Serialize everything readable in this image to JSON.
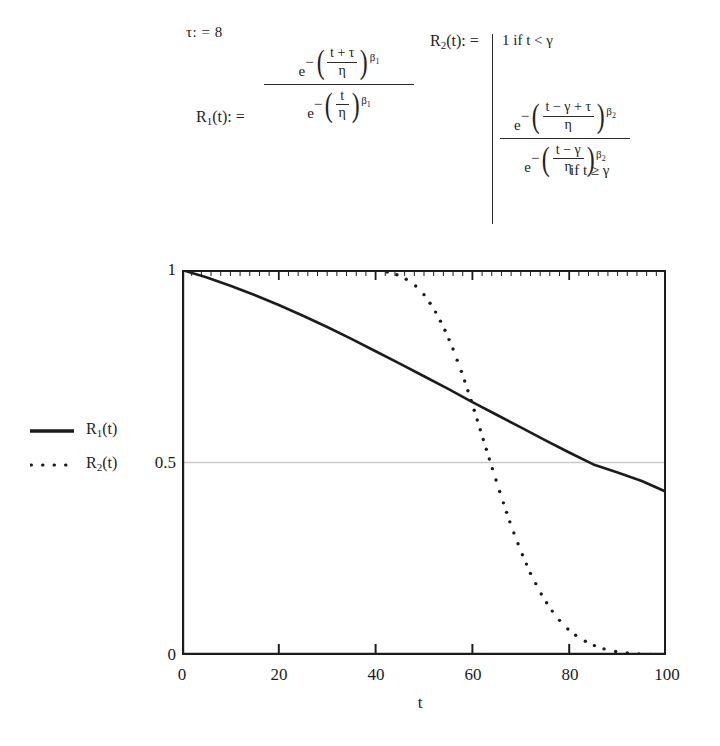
{
  "formulas": {
    "tau_assignment": "τ: = 8",
    "r1_label": "R",
    "r1_sub": "1",
    "r1_assign": "(t): =",
    "r1_numerator": {
      "e": "e",
      "minus": "−",
      "num": "t + τ",
      "den": "η",
      "exponent_base": "β",
      "exponent_sub": "1"
    },
    "r1_denominator": {
      "e": "e",
      "minus": "−",
      "num": "t",
      "den": "η",
      "exponent_base": "β",
      "exponent_sub": "1"
    },
    "r2_label": "R",
    "r2_sub": "2",
    "r2_assign": "(t): =",
    "r2_case1": "1 if t < γ",
    "r2_case2_condition": "if t ≥ γ",
    "r2_numerator": {
      "e": "e",
      "minus": "−",
      "num": "t − γ + τ",
      "den": "η",
      "exponent_base": "β",
      "exponent_sub": "2"
    },
    "r2_denominator": {
      "e": "e",
      "minus": "−",
      "num": "t − γ",
      "den": "η",
      "exponent_base": "β",
      "exponent_sub": "2"
    }
  },
  "legend": {
    "items": [
      {
        "label_base": "R",
        "label_sub": "1",
        "label_tail": "(t)",
        "style": "solid",
        "color": "#1c1c1c"
      },
      {
        "label_base": "R",
        "label_sub": "2",
        "label_tail": "(t)",
        "style": "dotted",
        "color": "#1c1c1c"
      }
    ]
  },
  "chart_data": {
    "type": "line",
    "title": "",
    "xlabel": "t",
    "ylabel": "",
    "xlim": [
      0,
      100
    ],
    "ylim": [
      0,
      1
    ],
    "xticks": [
      0,
      20,
      40,
      60,
      80,
      100
    ],
    "xtick_labels": [
      "0",
      "20",
      "40",
      "60",
      "80",
      "100"
    ],
    "yticks": [
      0,
      0.5,
      1
    ],
    "ytick_labels": [
      "0",
      "0.5",
      "1"
    ],
    "grid": true,
    "gridlines_y": [
      0.5
    ],
    "legend_position": "left-outside",
    "series": [
      {
        "name": "R_1(t)",
        "style": "solid",
        "color": "#1c1c1c",
        "x": [
          0,
          5,
          10,
          15,
          20,
          25,
          30,
          35,
          40,
          45,
          50,
          55,
          60,
          65,
          70,
          75,
          80,
          85,
          90,
          95,
          100
        ],
        "y": [
          1.0,
          0.981,
          0.959,
          0.935,
          0.909,
          0.881,
          0.852,
          0.821,
          0.789,
          0.757,
          0.724,
          0.691,
          0.657,
          0.624,
          0.591,
          0.558,
          0.526,
          0.495,
          0.474,
          0.452,
          0.424
        ]
      },
      {
        "name": "R_2(t)",
        "style": "dotted",
        "color": "#1c1c1c",
        "x": [
          0,
          5,
          10,
          15,
          20,
          25,
          30,
          35,
          40,
          42,
          44,
          46,
          48,
          50,
          52,
          54,
          56,
          58,
          60,
          62,
          64,
          66,
          68,
          70,
          72,
          74,
          76,
          78,
          80,
          82,
          84,
          86,
          88,
          90,
          92,
          94,
          96,
          98,
          100
        ],
        "y": [
          1.0,
          1.0,
          1.0,
          1.0,
          1.0,
          1.0,
          1.0,
          1.0,
          1.0,
          0.996,
          0.99,
          0.979,
          0.962,
          0.936,
          0.9,
          0.853,
          0.795,
          0.727,
          0.651,
          0.57,
          0.489,
          0.41,
          0.336,
          0.27,
          0.212,
          0.163,
          0.122,
          0.09,
          0.064,
          0.045,
          0.031,
          0.02,
          0.013,
          0.008,
          0.005,
          0.003,
          0.002,
          0.001,
          0.0
        ]
      }
    ],
    "annotations": {
      "r1_crosses_half_at_t": 80,
      "r2_crosses_half_at_t": 66,
      "r2_plateau_end_t": 41,
      "r1_end_value": 0.42
    }
  }
}
